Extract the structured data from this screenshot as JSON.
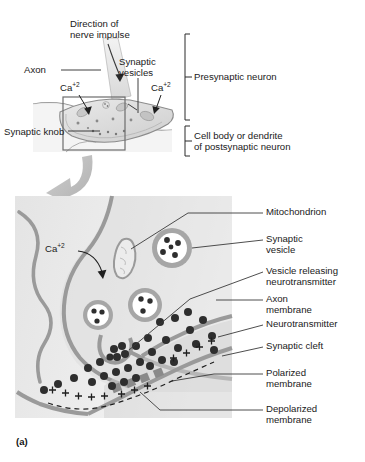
{
  "figure": {
    "panel_letter": "(a)",
    "caption_topic": "Chemical synapse: synaptic knob and neurotransmitter release"
  },
  "top_diagram": {
    "labels": {
      "direction_line1": "Direction of",
      "direction_line2": "nerve impulse",
      "axon": "Axon",
      "synaptic_vesicles_line1": "Synaptic",
      "synaptic_vesicles_line2": "vesicles",
      "calcium_left": "Ca",
      "calcium_left_charge": "+2",
      "calcium_right": "Ca",
      "calcium_right_charge": "+2",
      "synaptic_knob": "Synaptic knob",
      "presynaptic_neuron": "Presynaptic neuron",
      "postsynaptic_line1": "Cell body or dendrite",
      "postsynaptic_line2": "of postsynaptic neuron"
    }
  },
  "bottom_diagram": {
    "calcium": "Ca",
    "calcium_charge": "+2",
    "callouts": [
      {
        "id": "mitochondrion",
        "label_line1": "Mitochondrion",
        "label_line2": ""
      },
      {
        "id": "synaptic-vesicle",
        "label_line1": "Synaptic",
        "label_line2": "vesicle"
      },
      {
        "id": "vesicle-releasing",
        "label_line1": "Vesicle releasing",
        "label_line2": "neurotransmitter"
      },
      {
        "id": "axon-membrane",
        "label_line1": "Axon",
        "label_line2": "membrane"
      },
      {
        "id": "neurotransmitter",
        "label_line1": "Neurotransmitter",
        "label_line2": ""
      },
      {
        "id": "synaptic-cleft",
        "label_line1": "Synaptic cleft",
        "label_line2": ""
      },
      {
        "id": "polarized-membrane",
        "label_line1": "Polarized",
        "label_line2": "membrane"
      },
      {
        "id": "depolarized-membrane",
        "label_line1": "Depolarized",
        "label_line2": "membrane"
      }
    ],
    "charge_symbol": "+"
  },
  "colors": {
    "membrane_gray": "#9a9a9a",
    "cytoplasm": "#dcdcdc",
    "cleft_fill": "#ffffff",
    "vesicle_ring": "#a6a6a6",
    "vesicle_core": "#ffffff",
    "neurotransmitter_dot": "#333333",
    "depolarized_block": "#8e8e8e",
    "arrow_gray": "#bdbdbd",
    "leader_line": "#3a3a3a",
    "text": "#1a1a1a",
    "panel_bg": "#e6e6e6"
  }
}
